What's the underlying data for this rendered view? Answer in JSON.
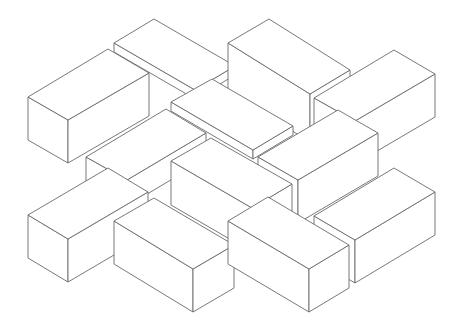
{
  "diagram": {
    "type": "isometric-line-drawing",
    "background": "#ffffff",
    "stroke_color": "#6a6a6a",
    "boxes": [
      {
        "id": "B",
        "label": "top-center slab",
        "h": 9,
        "top": [
          [
            114,
            43
          ],
          [
            154,
            19
          ],
          [
            235,
            66
          ],
          [
            195,
            90
          ]
        ]
      },
      {
        "id": "C",
        "label": "top-right-center block",
        "h": 48,
        "top": [
          [
            228,
            43
          ],
          [
            269,
            19
          ],
          [
            350,
            70
          ],
          [
            310,
            94
          ]
        ]
      },
      {
        "id": "A",
        "label": "top-left block",
        "h": 43,
        "top": [
          [
            28,
            97
          ],
          [
            108,
            49
          ],
          [
            149,
            73
          ],
          [
            68,
            120
          ]
        ]
      },
      {
        "id": "D",
        "label": "right block",
        "h": 43,
        "top": [
          [
            314,
            98
          ],
          [
            394,
            50
          ],
          [
            435,
            74
          ],
          [
            355,
            121
          ]
        ]
      },
      {
        "id": "E",
        "label": "center slab",
        "h": 9,
        "top": [
          [
            171,
            102
          ],
          [
            212,
            79
          ],
          [
            293,
            126
          ],
          [
            253,
            150
          ]
        ]
      },
      {
        "id": "F",
        "label": "left-middle slab",
        "h": 26,
        "top": [
          [
            86,
            157
          ],
          [
            166,
            109
          ],
          [
            206,
            133
          ],
          [
            127,
            180
          ]
        ]
      },
      {
        "id": "H",
        "label": "right-center block",
        "h": 43,
        "top": [
          [
            258,
            157
          ],
          [
            338,
            110
          ],
          [
            378,
            133
          ],
          [
            298,
            180
          ]
        ]
      },
      {
        "id": "G",
        "label": "center block",
        "h": 44,
        "top": [
          [
            171,
            161
          ],
          [
            211,
            138
          ],
          [
            292,
            184
          ],
          [
            252,
            208
          ]
        ]
      },
      {
        "id": "L",
        "label": "bottom-right block",
        "h": 43,
        "top": [
          [
            314,
            216
          ],
          [
            394,
            168
          ],
          [
            435,
            192
          ],
          [
            355,
            240
          ]
        ]
      },
      {
        "id": "I",
        "label": "bottom-left block",
        "h": 43,
        "top": [
          [
            28,
            215
          ],
          [
            108,
            168
          ],
          [
            148,
            192
          ],
          [
            68,
            239
          ]
        ]
      },
      {
        "id": "J",
        "label": "bottom-center-left block",
        "h": 43,
        "top": [
          [
            114,
            221
          ],
          [
            154,
            198
          ],
          [
            234,
            245
          ],
          [
            193,
            269
          ]
        ]
      },
      {
        "id": "K",
        "label": "bottom-center-right block",
        "h": 43,
        "top": [
          [
            228,
            221
          ],
          [
            268,
            197
          ],
          [
            349,
            245
          ],
          [
            309,
            269
          ]
        ]
      }
    ]
  }
}
